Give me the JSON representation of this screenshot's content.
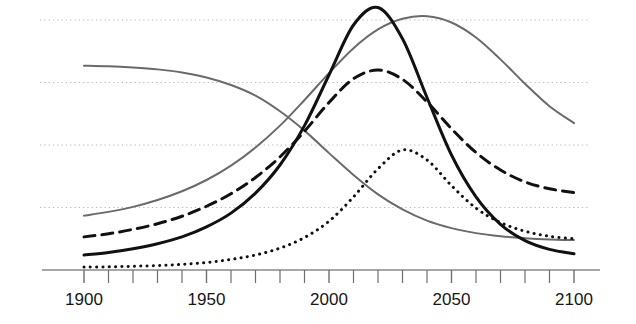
{
  "chart_data": {
    "type": "line",
    "title": "",
    "subtitle": "",
    "xlabel": "",
    "ylabel": "",
    "xlim": [
      1900,
      2100
    ],
    "ylim": [
      0,
      5
    ],
    "grid": true,
    "grid_axis": "y",
    "grid_style": "dotted",
    "legend": "none",
    "x_ticks_major": [
      1900,
      1950,
      2000,
      2050,
      2100
    ],
    "x_tick_labels": [
      "1900",
      "1950",
      "2000",
      "2050",
      "2100"
    ],
    "x_ticks_minor_step": 10,
    "y_gridlines": [
      1,
      2,
      3,
      4
    ],
    "y_ticks_visible": false,
    "x": [
      1900,
      1910,
      1920,
      1930,
      1940,
      1950,
      1960,
      1970,
      1980,
      1990,
      2000,
      2010,
      2020,
      2030,
      2040,
      2050,
      2060,
      2070,
      2080,
      2090,
      2100
    ],
    "series": [
      {
        "name": "gray-declining-curve",
        "style": "solid",
        "color": "#6a6a6a",
        "width": 2,
        "values": [
          3.27,
          3.26,
          3.24,
          3.21,
          3.16,
          3.08,
          2.96,
          2.79,
          2.54,
          2.23,
          1.87,
          1.52,
          1.21,
          0.97,
          0.79,
          0.67,
          0.59,
          0.54,
          0.51,
          0.49,
          0.48
        ]
      },
      {
        "name": "gray-rising-peak-curve",
        "style": "solid",
        "color": "#6a6a6a",
        "width": 2,
        "values": [
          0.87,
          0.93,
          1.01,
          1.12,
          1.26,
          1.44,
          1.67,
          1.96,
          2.31,
          2.72,
          3.15,
          3.55,
          3.85,
          4.02,
          4.06,
          3.96,
          3.72,
          3.37,
          2.98,
          2.62,
          2.35
        ]
      },
      {
        "name": "black-dashed-curve",
        "style": "dashed",
        "color": "#111111",
        "width": 3,
        "values": [
          0.53,
          0.58,
          0.65,
          0.74,
          0.86,
          1.02,
          1.22,
          1.48,
          1.81,
          2.22,
          2.68,
          3.06,
          3.2,
          3.05,
          2.69,
          2.26,
          1.88,
          1.6,
          1.41,
          1.3,
          1.24
        ]
      },
      {
        "name": "black-solid-curve",
        "style": "solid",
        "color": "#111111",
        "width": 3,
        "values": [
          0.24,
          0.28,
          0.34,
          0.42,
          0.53,
          0.69,
          0.91,
          1.23,
          1.68,
          2.31,
          3.12,
          3.92,
          4.2,
          3.7,
          2.76,
          1.84,
          1.17,
          0.73,
          0.47,
          0.33,
          0.26
        ]
      },
      {
        "name": "black-dotted-curve",
        "style": "dotted",
        "color": "#111111",
        "width": 3,
        "values": [
          0.05,
          0.05,
          0.06,
          0.07,
          0.09,
          0.12,
          0.17,
          0.24,
          0.35,
          0.52,
          0.78,
          1.17,
          1.62,
          1.92,
          1.76,
          1.35,
          0.99,
          0.76,
          0.62,
          0.54,
          0.5
        ]
      }
    ],
    "annotations": []
  },
  "axis": {
    "x_axis_name": "year-axis",
    "axis_color": "#8a8a8a"
  }
}
